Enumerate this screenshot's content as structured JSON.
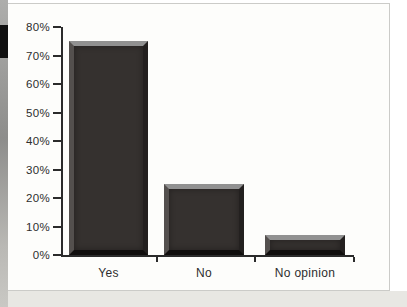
{
  "page": {
    "panel_background": "#fdfdfb",
    "panel_border_color": "#cbcbc8",
    "page_edge_color": "#8d8d8b",
    "bottom_band_color": "#e8e7e3",
    "highlight_mark_color": "#101010"
  },
  "chart_data": {
    "type": "bar",
    "title": "",
    "xlabel": "",
    "ylabel": "",
    "categories": [
      "Yes",
      "No",
      "No opinion"
    ],
    "values": [
      75,
      25,
      7
    ],
    "value_unit": "%",
    "ylim": [
      0,
      80
    ],
    "ytick_step": 10,
    "ytick_labels": [
      "0%",
      "10%",
      "20%",
      "30%",
      "40%",
      "50%",
      "60%",
      "70%",
      "80%"
    ],
    "grid": false,
    "legend": "none",
    "axis_color": "#2b2b2b",
    "bar_face_color": "#35312f",
    "bar_bevel": {
      "top": "#919191",
      "left": "#54504e",
      "right": "#23201f",
      "bottom": "#100e0d"
    }
  }
}
